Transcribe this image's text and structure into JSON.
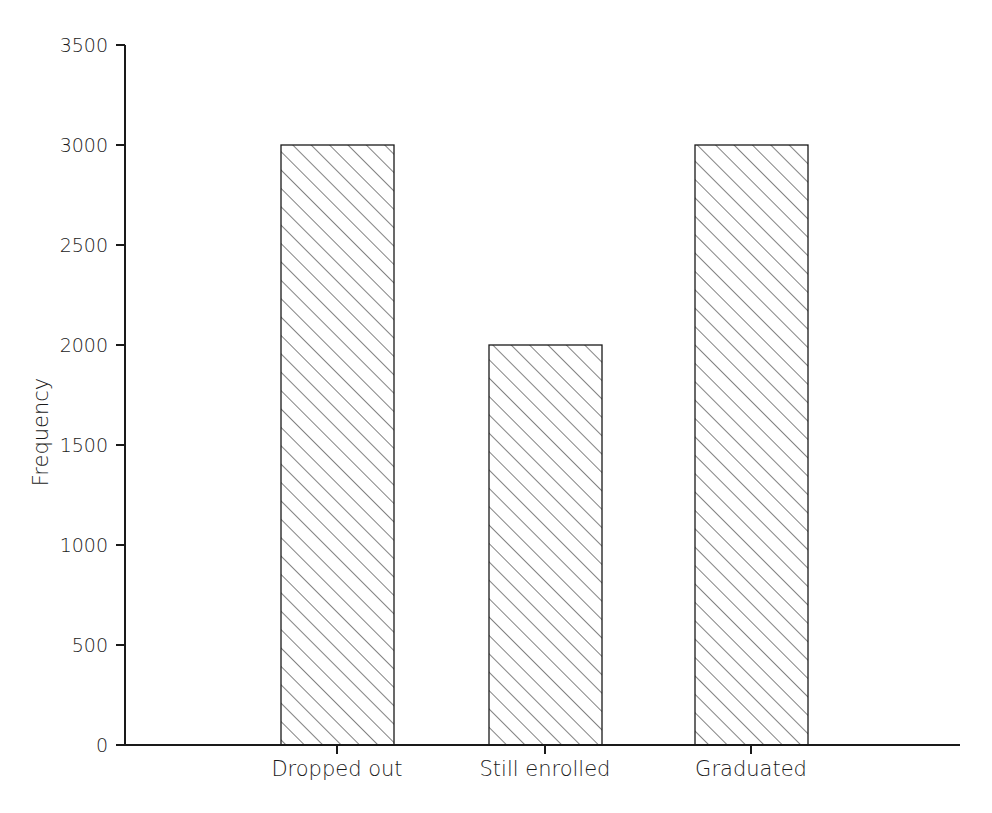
{
  "chart_data": {
    "type": "bar",
    "title": "",
    "subtitle": "",
    "xlabel": "",
    "ylabel": "Frequency",
    "categories": [
      "Dropped out",
      "Still enrolled",
      "Graduated"
    ],
    "values": [
      2700,
      2000,
      3000
    ],
    "ylim": [
      0,
      3500
    ],
    "yticks": [
      0,
      500,
      1000,
      1500,
      2000,
      2500,
      3000,
      3500
    ],
    "ytick_labels": [
      "0",
      "500",
      "1000",
      "1500",
      "2000",
      "2500",
      "3000",
      "3500"
    ],
    "grid": false,
    "legend": null,
    "legend_position": "none",
    "bar_fill": "hatched-diagonal",
    "bar_fill_color": "#ffffff",
    "bar_edge_color": "#1a1a1a",
    "hatch_color": "#1a1a1a",
    "axis_color": "#1a1a1a",
    "background_color": "#ffffff",
    "tick_direction": "out",
    "annotations": []
  },
  "axes": {
    "y_axis_name": "y-axis",
    "x_axis_name": "x-axis"
  }
}
